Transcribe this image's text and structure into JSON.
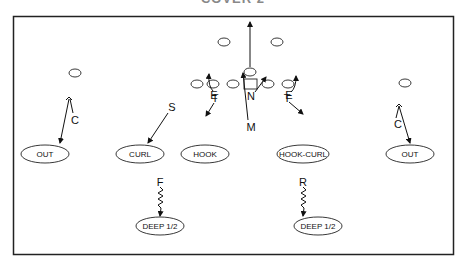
{
  "title": "COVER 2",
  "defenders": {
    "corner_left": "C",
    "corner_right": "C",
    "strong_safety": "S",
    "tackle_left": "T",
    "tackle_right": "T",
    "end_left": "E",
    "end_right": "E",
    "nose": "N",
    "mike": "M",
    "free_safety": "F",
    "rover": "R"
  },
  "zones": {
    "out_left": "OUT",
    "curl": "CURL",
    "hook": "HOOK",
    "hook_curl": "HOOK-CURL",
    "out_right": "OUT",
    "deep_left": "DEEP 1/2",
    "deep_right": "DEEP 1/2"
  }
}
